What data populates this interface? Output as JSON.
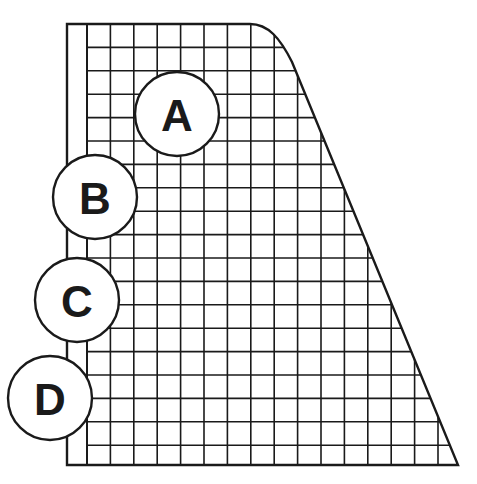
{
  "diagram": {
    "colors": {
      "line": "#1a1a1a",
      "background": "#ffffff",
      "circle_fill": "#ffffff"
    },
    "shape": {
      "outer_left_x": 67,
      "strip_right_x": 87,
      "top_y": 24,
      "bottom_y": 465,
      "top_right_x": 250,
      "bottom_right_x": 458
    },
    "grid": {
      "cell_size": 23.4,
      "columns_start_x": 87,
      "rows_start_y": 24
    },
    "callouts": [
      {
        "letter": "A",
        "cx": 177,
        "cy": 114,
        "r": 42
      },
      {
        "letter": "B",
        "cx": 95,
        "cy": 197,
        "r": 42
      },
      {
        "letter": "C",
        "cx": 77,
        "cy": 300,
        "r": 42
      },
      {
        "letter": "D",
        "cx": 50,
        "cy": 398,
        "r": 42
      }
    ]
  }
}
